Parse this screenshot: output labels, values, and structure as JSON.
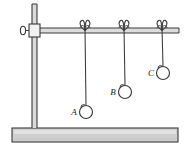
{
  "figure": {
    "name": "pendulum-apparatus-diagram",
    "background_color": "#ffffff",
    "line_color": "#333333",
    "base_fill": "#cfcfcf",
    "rod_fill": "#d8d8d8"
  },
  "stand": {
    "base_name": "stand-base",
    "vertical_rod_name": "vertical-rod",
    "horizontal_rod_name": "horizontal-rod",
    "clamp_name": "rod-clamp",
    "knob_name": "clamp-thumbscrew-knob"
  },
  "pendulums": [
    {
      "label": "A",
      "anchor_x": 85,
      "bob_cx": 86,
      "bob_cy": 112,
      "bob_r": 6.5,
      "label_x": 74,
      "label_y": 115,
      "knot_name": "bow-knot-a",
      "string_name": "string-a",
      "bob_name": "bob-a"
    },
    {
      "label": "B",
      "anchor_x": 124,
      "bob_cx": 125,
      "bob_cy": 92,
      "bob_r": 6.5,
      "label_x": 113,
      "label_y": 95,
      "knot_name": "bow-knot-b",
      "string_name": "string-b",
      "bob_name": "bob-b"
    },
    {
      "label": "C",
      "anchor_x": 162,
      "bob_cx": 163,
      "bob_cy": 73,
      "bob_r": 6.5,
      "label_x": 151,
      "label_y": 76,
      "knot_name": "bow-knot-c",
      "string_name": "string-c",
      "bob_name": "bob-c"
    }
  ]
}
